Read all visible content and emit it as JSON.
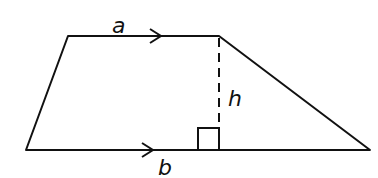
{
  "diagram": {
    "type": "trapezoid",
    "labels": {
      "top_base": "a",
      "bottom_base": "b",
      "height": "h"
    },
    "vertices": {
      "top_left": [
        68,
        36
      ],
      "top_right": [
        219,
        36
      ],
      "bottom_right": [
        370,
        150
      ],
      "bottom_left": [
        26,
        150
      ]
    },
    "colors": {
      "stroke": "#111111",
      "background": "#ffffff"
    }
  }
}
